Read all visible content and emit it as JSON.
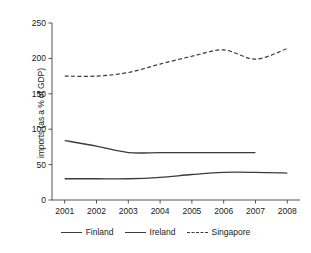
{
  "chart_data": {
    "type": "line",
    "title": "",
    "xlabel": "",
    "ylabel": "imports (as a % of GDP)",
    "categories": [
      "2001",
      "2002",
      "2003",
      "2004",
      "2005",
      "2006",
      "2007",
      "2008"
    ],
    "x": [
      2001,
      2002,
      2003,
      2004,
      2005,
      2006,
      2007,
      2008
    ],
    "xlim": [
      2000.6,
      2008.4
    ],
    "ylim": [
      0,
      250
    ],
    "yticks": [
      0,
      50,
      100,
      150,
      200,
      250
    ],
    "ytick_labels": [
      "0",
      "50",
      "100",
      "150",
      "200",
      "250"
    ],
    "grid": false,
    "legend_position": "bottom",
    "series": [
      {
        "name": "Finland",
        "style": "solid",
        "color": "#3b3b3b",
        "values": [
          30,
          30,
          30,
          32,
          36,
          39,
          39,
          38
        ]
      },
      {
        "name": "Ireland",
        "style": "solid",
        "color": "#3b3b3b",
        "values": [
          84,
          76,
          67,
          67,
          67,
          67,
          67,
          null
        ]
      },
      {
        "name": "Singapore",
        "style": "dashed",
        "color": "#3b3b3b",
        "values": [
          175,
          175,
          180,
          192,
          203,
          212,
          199,
          214
        ]
      }
    ]
  },
  "legend": {
    "items": [
      {
        "label": "Finland",
        "style": "solid"
      },
      {
        "label": "Ireland",
        "style": "solid"
      },
      {
        "label": "Singapore",
        "style": "dashed"
      }
    ]
  }
}
